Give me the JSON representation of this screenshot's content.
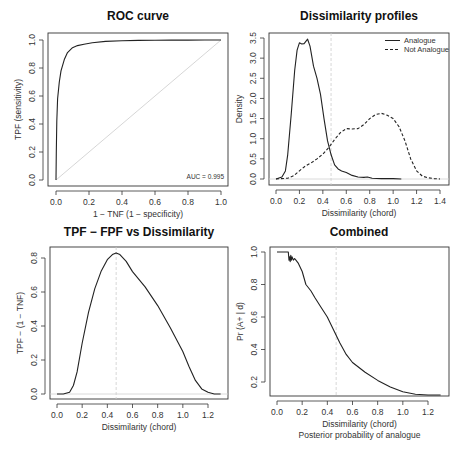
{
  "chart_data": [
    {
      "id": "roc",
      "type": "line",
      "title": "ROC curve",
      "xlabel": "1 − TNF (1 − specificity)",
      "ylabel": "TPF (sensitivity)",
      "xlim": [
        0,
        1
      ],
      "ylim": [
        0,
        1
      ],
      "xticks": [
        0.0,
        0.2,
        0.4,
        0.6,
        0.8,
        1.0
      ],
      "yticks": [
        0.0,
        0.2,
        0.4,
        0.6,
        0.8,
        1.0
      ],
      "annotation": "AUC = 0.995",
      "reference_line": {
        "from": [
          0,
          0
        ],
        "to": [
          1,
          1
        ],
        "color": "#cccccc"
      },
      "series": [
        {
          "name": "ROC",
          "style": "solid",
          "x": [
            0,
            0.002,
            0.005,
            0.01,
            0.02,
            0.03,
            0.05,
            0.07,
            0.1,
            0.13,
            0.17,
            0.22,
            0.3,
            0.4,
            0.5,
            0.6,
            0.7,
            0.8,
            0.9,
            1.0
          ],
          "y": [
            0,
            0.2,
            0.42,
            0.58,
            0.7,
            0.78,
            0.86,
            0.91,
            0.945,
            0.96,
            0.97,
            0.98,
            0.99,
            0.995,
            0.997,
            0.998,
            0.999,
            0.999,
            1.0,
            1.0
          ]
        }
      ],
      "box": {
        "x0": 48,
        "y0": 33,
        "x1": 228,
        "y1": 186
      },
      "map": {
        "xa": 56,
        "xb": 221,
        "ya": 180,
        "yb": 40
      }
    },
    {
      "id": "profiles",
      "type": "line",
      "title": "Dissimilarity profiles",
      "xlabel": "Dissimilarity (chord)",
      "ylabel": "Density",
      "xlim": [
        0,
        1.4
      ],
      "ylim": [
        0,
        3.5
      ],
      "xticks": [
        0.0,
        0.2,
        0.4,
        0.6,
        0.8,
        1.0,
        1.2,
        1.4
      ],
      "yticks": [
        0.0,
        0.5,
        1.0,
        1.5,
        2.0,
        2.5,
        3.0,
        3.5
      ],
      "vline": 0.47,
      "legend": [
        {
          "label": "Analogue",
          "style": "solid"
        },
        {
          "label": "Not Analogue",
          "style": "dashed"
        }
      ],
      "series": [
        {
          "name": "Analogue",
          "style": "solid",
          "x": [
            0.0,
            0.05,
            0.08,
            0.1,
            0.13,
            0.16,
            0.18,
            0.2,
            0.22,
            0.24,
            0.27,
            0.29,
            0.32,
            0.35,
            0.38,
            0.41,
            0.44,
            0.47,
            0.5,
            0.53,
            0.56,
            0.6,
            0.65,
            0.7,
            0.75,
            0.78,
            0.82,
            0.9,
            1.0,
            1.07
          ],
          "y": [
            0.0,
            0.05,
            0.2,
            0.6,
            1.6,
            2.7,
            3.2,
            3.38,
            3.35,
            3.36,
            3.47,
            3.3,
            2.8,
            2.5,
            2.1,
            1.5,
            0.95,
            0.6,
            0.35,
            0.25,
            0.2,
            0.16,
            0.09,
            0.05,
            0.04,
            0.05,
            0.02,
            0.01,
            0.01,
            0.0
          ]
        },
        {
          "name": "Not Analogue",
          "style": "dashed",
          "x": [
            0.0,
            0.1,
            0.15,
            0.2,
            0.25,
            0.3,
            0.35,
            0.4,
            0.45,
            0.5,
            0.55,
            0.6,
            0.65,
            0.7,
            0.75,
            0.8,
            0.85,
            0.9,
            0.95,
            1.0,
            1.05,
            1.1,
            1.15,
            1.2,
            1.25,
            1.3,
            1.35,
            1.4
          ],
          "y": [
            0.0,
            0.02,
            0.08,
            0.2,
            0.32,
            0.4,
            0.5,
            0.62,
            0.78,
            0.98,
            1.15,
            1.25,
            1.24,
            1.25,
            1.35,
            1.5,
            1.6,
            1.63,
            1.58,
            1.5,
            1.3,
            0.95,
            0.5,
            0.2,
            0.07,
            0.03,
            0.01,
            0.0
          ]
        }
      ],
      "box": {
        "x0": 269,
        "y0": 33,
        "x1": 449,
        "y1": 185
      },
      "map": {
        "xa": 276,
        "xb": 440,
        "ya": 179,
        "yb": 38
      }
    },
    {
      "id": "tpf_fpf",
      "type": "line",
      "title": "TPF − FPF vs Dissimilarity",
      "xlabel": "Dissimilarity (chord)",
      "ylabel": "TPF − (1 − TNF)",
      "xlim": [
        0,
        1.3
      ],
      "ylim": [
        0,
        0.85
      ],
      "xticks": [
        0.0,
        0.2,
        0.4,
        0.6,
        0.8,
        1.0,
        1.2
      ],
      "yticks": [
        0.0,
        0.2,
        0.4,
        0.6,
        0.8
      ],
      "vline": 0.47,
      "series": [
        {
          "name": "TPF-FPF",
          "style": "solid",
          "x": [
            0.0,
            0.05,
            0.1,
            0.13,
            0.16,
            0.2,
            0.25,
            0.3,
            0.35,
            0.4,
            0.44,
            0.47,
            0.5,
            0.55,
            0.6,
            0.7,
            0.8,
            0.9,
            1.0,
            1.05,
            1.1,
            1.15,
            1.2,
            1.25,
            1.3
          ],
          "y": [
            0.0,
            0.0,
            0.01,
            0.05,
            0.13,
            0.3,
            0.48,
            0.62,
            0.72,
            0.79,
            0.82,
            0.83,
            0.82,
            0.78,
            0.72,
            0.63,
            0.52,
            0.39,
            0.25,
            0.16,
            0.08,
            0.03,
            0.01,
            0.0,
            0.0
          ]
        }
      ],
      "box": {
        "x0": 50,
        "y0": 247,
        "x1": 228,
        "y1": 399
      },
      "map": {
        "xa": 57,
        "xb": 208,
        "xbv": 1.2,
        "ya": 394,
        "yb": 258,
        "ybv": 0.8
      }
    },
    {
      "id": "combined",
      "type": "line",
      "title": "Combined",
      "xlabel": "Dissimilarity (chord)",
      "subtitle": "Posterior probability of analogue",
      "ylabel": "Pr (A+ | d)",
      "xlim": [
        0,
        1.3
      ],
      "ylim": [
        0.12,
        1.0
      ],
      "xticks": [
        0.0,
        0.2,
        0.4,
        0.6,
        0.8,
        1.0,
        1.2
      ],
      "yticks": [
        0.2,
        0.4,
        0.6,
        0.8,
        1.0
      ],
      "vline": 0.47,
      "series": [
        {
          "name": "Posterior",
          "style": "solid",
          "x": [
            0.0,
            0.09,
            0.095,
            0.1,
            0.105,
            0.11,
            0.115,
            0.12,
            0.13,
            0.14,
            0.15,
            0.17,
            0.2,
            0.23,
            0.27,
            0.3,
            0.35,
            0.4,
            0.45,
            0.5,
            0.55,
            0.6,
            0.7,
            0.8,
            0.9,
            1.0,
            1.1,
            1.2,
            1.3
          ],
          "y": [
            1.0,
            1.0,
            0.95,
            0.97,
            0.94,
            0.98,
            0.95,
            0.97,
            0.95,
            0.96,
            0.95,
            0.93,
            0.88,
            0.8,
            0.76,
            0.72,
            0.66,
            0.6,
            0.52,
            0.44,
            0.37,
            0.32,
            0.26,
            0.21,
            0.17,
            0.14,
            0.125,
            0.12,
            0.12
          ]
        }
      ],
      "box": {
        "x0": 270,
        "y0": 247,
        "x1": 449,
        "y1": 396
      },
      "map": {
        "xa": 277,
        "xb": 428,
        "xbv": 1.2,
        "ya": 382,
        "yav": 0.2,
        "yb": 252,
        "ybv": 1.0
      }
    }
  ],
  "panel_titles": {
    "roc": "ROC curve",
    "profiles": "Dissimilarity profiles",
    "tpf_fpf": "TPF − FPF vs Dissimilarity",
    "combined": "Combined"
  }
}
